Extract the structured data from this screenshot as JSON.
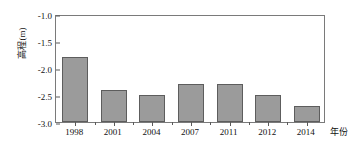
{
  "chart_data": {
    "type": "bar",
    "title": "",
    "subtitle": "",
    "xlabel": "年份",
    "ylabel": "高程(m)",
    "categories": [
      "1998",
      "2001",
      "2004",
      "2007",
      "2011",
      "2012",
      "2014"
    ],
    "values": [
      -1.8,
      -2.4,
      -2.5,
      -2.3,
      -2.3,
      -2.5,
      -2.7
    ],
    "ylim": [
      -3.0,
      -1.0
    ],
    "ytick_labels": [
      "-1.0",
      "-1.5",
      "-2.0",
      "-2.5",
      "-3.0"
    ],
    "ytick_values": [
      -1.0,
      -1.5,
      -2.0,
      -2.5,
      -3.0
    ],
    "grid": false,
    "legend": null,
    "bar_color": "#9b9b9b",
    "bar_edge_color": "#5d5d5d",
    "axis_color": "#7a7a7a",
    "baseline": -3.0,
    "series": [
      {
        "name": "高程(m)",
        "values": [
          -1.8,
          -2.4,
          -2.5,
          -2.3,
          -2.3,
          -2.5,
          -2.7
        ]
      }
    ]
  }
}
